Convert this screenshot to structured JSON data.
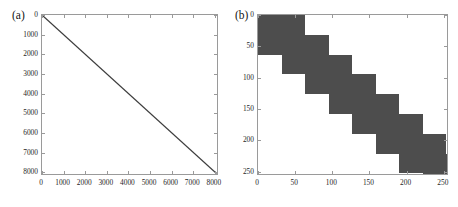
{
  "figure": {
    "background": "#ffffff",
    "panels": [
      {
        "tag": "(a)",
        "plot_kind": "spy-matrix-sparsity"
      },
      {
        "tag": "(b)",
        "plot_kind": "spy-matrix-sparsity"
      }
    ]
  },
  "panel_a": {
    "label": "(a)",
    "x_ticks": [
      "0",
      "1000",
      "2000",
      "3000",
      "4000",
      "5000",
      "6000",
      "7000",
      "8000"
    ],
    "y_ticks": [
      "0",
      "1000",
      "2000",
      "3000",
      "4000",
      "5000",
      "6000",
      "7000",
      "8000"
    ]
  },
  "panel_b": {
    "label": "(b)",
    "x_ticks": [
      "0",
      "50",
      "100",
      "150",
      "200",
      "250"
    ],
    "y_ticks": [
      "0",
      "50",
      "100",
      "150",
      "200",
      "250"
    ]
  },
  "colors": {
    "sparsity_fill": "#4d4d4d",
    "diagonal_line": "#3c3c3c",
    "axis_line": "#9a9a9a",
    "text": "#1a1a1a",
    "background": "#ffffff"
  },
  "chart_data": [
    {
      "type": "scatter",
      "subplot": "(a)",
      "title": "",
      "xlabel": "",
      "ylabel": "",
      "xlim": [
        0,
        8192
      ],
      "ylim": [
        8192,
        0
      ],
      "y_axis_inverted": true,
      "grid": false,
      "legend": null,
      "xticks": [
        0,
        1000,
        2000,
        3000,
        4000,
        5000,
        6000,
        7000,
        8000
      ],
      "yticks": [
        0,
        1000,
        2000,
        3000,
        4000,
        5000,
        6000,
        7000,
        8000
      ],
      "xticklabels": [
        "0",
        "1000",
        "2000",
        "3000",
        "4000",
        "5000",
        "6000",
        "7000",
        "8000"
      ],
      "yticklabels": [
        "0",
        "1000",
        "2000",
        "3000",
        "4000",
        "5000",
        "6000",
        "7000",
        "8000"
      ],
      "description": "Sparsity pattern of an 8192x8192 matrix: nonzeros lie on the main diagonal only, drawn as a straight line from (0,0) at top-left to (8192,8192) at bottom-right.",
      "series": [
        {
          "name": "main diagonal",
          "marker": "point",
          "color": "#3c3c3c",
          "x": [
            0,
            8192
          ],
          "y": [
            0,
            8192
          ]
        }
      ]
    },
    {
      "type": "heatmap",
      "subplot": "(b)",
      "title": "",
      "xlabel": "",
      "ylabel": "",
      "xlim": [
        0,
        257
      ],
      "ylim": [
        257,
        0
      ],
      "y_axis_inverted": true,
      "grid": false,
      "legend": null,
      "xticks": [
        0,
        50,
        100,
        150,
        200,
        250
      ],
      "yticks": [
        0,
        50,
        100,
        150,
        200,
        250
      ],
      "xticklabels": [
        "0",
        "50",
        "100",
        "150",
        "200",
        "250"
      ],
      "yticklabels": [
        "0",
        "50",
        "100",
        "150",
        "200",
        "250"
      ],
      "fill_color": "#4d4d4d",
      "empty_color": "#ffffff",
      "description": "Sparsity pattern of a 257x257 block-banded matrix: a staircase of overlapping dense 64x64 blocks offset by 32 along the diagonal.",
      "block_size": 64,
      "block_step": 32,
      "blocks": [
        {
          "x": 0,
          "y": 0,
          "w": 64,
          "h": 64
        },
        {
          "x": 32,
          "y": 32,
          "w": 64,
          "h": 64
        },
        {
          "x": 64,
          "y": 64,
          "w": 64,
          "h": 64
        },
        {
          "x": 96,
          "y": 96,
          "w": 64,
          "h": 64
        },
        {
          "x": 128,
          "y": 128,
          "w": 64,
          "h": 64
        },
        {
          "x": 160,
          "y": 160,
          "w": 64,
          "h": 64
        },
        {
          "x": 192,
          "y": 192,
          "w": 64,
          "h": 64
        },
        {
          "x": 224,
          "y": 224,
          "w": 33,
          "h": 33
        }
      ]
    }
  ]
}
